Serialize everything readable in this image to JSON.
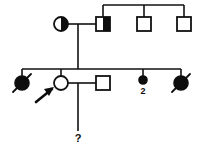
{
  "figure": {
    "kind": "pedigree-chart",
    "width": 201,
    "height": 151,
    "background_color": "#ffffff",
    "line_color": "#111111",
    "fill_color": "#0d0d0d"
  },
  "labels": {
    "sibling_count": "2",
    "unknown_status": "?"
  },
  "individuals": [
    {
      "id": "I-1",
      "symbol": "circle",
      "sex": "female",
      "status": "half-filled-right",
      "deceased": false,
      "proband": false,
      "x": 61,
      "y": 24,
      "r": 7
    },
    {
      "id": "I-2",
      "symbol": "square",
      "sex": "male",
      "status": "half-filled-right",
      "deceased": false,
      "proband": false,
      "x": 103,
      "y": 24,
      "size": 14
    },
    {
      "id": "I-3",
      "symbol": "square",
      "sex": "male",
      "status": "unaffected",
      "deceased": false,
      "proband": false,
      "x": 144,
      "y": 24,
      "size": 14
    },
    {
      "id": "I-4",
      "symbol": "square",
      "sex": "male",
      "status": "unaffected",
      "deceased": false,
      "proband": false,
      "x": 184,
      "y": 24,
      "size": 14
    },
    {
      "id": "II-1",
      "symbol": "circle",
      "sex": "female",
      "status": "affected",
      "deceased": true,
      "proband": false,
      "x": 22,
      "y": 83,
      "r": 7
    },
    {
      "id": "II-2",
      "symbol": "circle",
      "sex": "female",
      "status": "unaffected",
      "deceased": false,
      "proband": true,
      "x": 61,
      "y": 83,
      "r": 7
    },
    {
      "id": "II-3",
      "symbol": "square",
      "sex": "male",
      "status": "unaffected",
      "deceased": false,
      "proband": false,
      "x": 103,
      "y": 83,
      "size": 14
    },
    {
      "id": "II-4",
      "symbol": "circle",
      "sex": "female",
      "status": "affected",
      "deceased": false,
      "proband": false,
      "count": "2",
      "x": 143,
      "y": 80,
      "r": 4
    },
    {
      "id": "II-5",
      "symbol": "circle",
      "sex": "female",
      "status": "affected",
      "deceased": true,
      "proband": false,
      "x": 181,
      "y": 83,
      "r": 7
    },
    {
      "id": "III-1",
      "symbol": "unknown",
      "sex": "unknown",
      "status": "unknown",
      "deceased": false,
      "proband": false,
      "x": 78,
      "y": 140,
      "glyph": "?"
    }
  ],
  "connections": {
    "gen1_sibship_line": {
      "y": 5,
      "x1": 103,
      "x2": 184
    },
    "gen1_mating_line": {
      "y": 24,
      "x1": 68,
      "x2": 96
    },
    "gen1_descent_line": {
      "x": 78,
      "y1": 24,
      "y2": 69
    },
    "gen2_sibship_line": {
      "y": 69,
      "x1": 22,
      "x2": 181
    },
    "gen2_mating_line": {
      "y": 83,
      "x1": 68,
      "x2": 96
    },
    "gen3_descent_line": {
      "x": 78,
      "y1": 83,
      "y2": 131
    }
  }
}
